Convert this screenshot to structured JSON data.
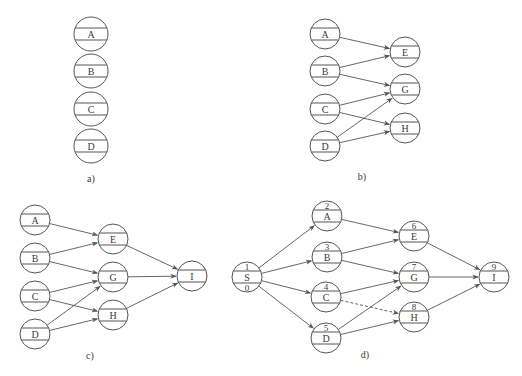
{
  "colors": {
    "stroke": "#555555",
    "text": "#3a3a3a",
    "background": "#ffffff"
  },
  "diagrams": [
    {
      "id": "a",
      "caption": "a)",
      "caption_pos": [
        91,
        182
      ],
      "radius": 17,
      "nodes": [
        {
          "id": "A",
          "label": "A",
          "x": 91,
          "y": 34
        },
        {
          "id": "B",
          "label": "B",
          "x": 91,
          "y": 71
        },
        {
          "id": "C",
          "label": "C",
          "x": 91,
          "y": 109
        },
        {
          "id": "D",
          "label": "D",
          "x": 91,
          "y": 146
        }
      ],
      "edges": []
    },
    {
      "id": "b",
      "caption": "b)",
      "caption_pos": [
        362,
        180
      ],
      "radius": 15,
      "nodes": [
        {
          "id": "A",
          "label": "A",
          "x": 325,
          "y": 34
        },
        {
          "id": "B",
          "label": "B",
          "x": 325,
          "y": 71
        },
        {
          "id": "C",
          "label": "C",
          "x": 325,
          "y": 109
        },
        {
          "id": "D",
          "label": "D",
          "x": 325,
          "y": 146
        },
        {
          "id": "E",
          "label": "E",
          "x": 405,
          "y": 52
        },
        {
          "id": "G",
          "label": "G",
          "x": 405,
          "y": 89
        },
        {
          "id": "H",
          "label": "H",
          "x": 405,
          "y": 128
        }
      ],
      "edges": [
        {
          "from": "A",
          "to": "E"
        },
        {
          "from": "B",
          "to": "E"
        },
        {
          "from": "B",
          "to": "G"
        },
        {
          "from": "C",
          "to": "G"
        },
        {
          "from": "C",
          "to": "H"
        },
        {
          "from": "D",
          "to": "G"
        },
        {
          "from": "D",
          "to": "H"
        }
      ]
    },
    {
      "id": "c",
      "caption": "c)",
      "caption_pos": [
        90,
        359
      ],
      "radius": 15,
      "nodes": [
        {
          "id": "A",
          "label": "A",
          "x": 35,
          "y": 220
        },
        {
          "id": "B",
          "label": "B",
          "x": 35,
          "y": 258
        },
        {
          "id": "C",
          "label": "C",
          "x": 35,
          "y": 296
        },
        {
          "id": "D",
          "label": "D",
          "x": 35,
          "y": 334
        },
        {
          "id": "E",
          "label": "E",
          "x": 113,
          "y": 239
        },
        {
          "id": "G",
          "label": "G",
          "x": 113,
          "y": 277
        },
        {
          "id": "H",
          "label": "H",
          "x": 113,
          "y": 315
        },
        {
          "id": "I",
          "label": "I",
          "x": 192,
          "y": 276
        }
      ],
      "edges": [
        {
          "from": "A",
          "to": "E"
        },
        {
          "from": "B",
          "to": "E"
        },
        {
          "from": "B",
          "to": "G"
        },
        {
          "from": "C",
          "to": "G"
        },
        {
          "from": "C",
          "to": "H"
        },
        {
          "from": "D",
          "to": "G"
        },
        {
          "from": "D",
          "to": "H"
        },
        {
          "from": "E",
          "to": "I"
        },
        {
          "from": "G",
          "to": "I"
        },
        {
          "from": "H",
          "to": "I"
        }
      ]
    },
    {
      "id": "d",
      "caption": "d)",
      "caption_pos": [
        365,
        358
      ],
      "radius": 15,
      "nodes": [
        {
          "id": "S",
          "num": "1",
          "label": "S",
          "bottom": "0",
          "x": 247,
          "y": 277
        },
        {
          "id": "A",
          "num": "2",
          "label": "A",
          "x": 327,
          "y": 216
        },
        {
          "id": "B",
          "num": "3",
          "label": "B",
          "x": 327,
          "y": 257
        },
        {
          "id": "C",
          "num": "4",
          "label": "C",
          "x": 326,
          "y": 297
        },
        {
          "id": "D",
          "num": "5",
          "label": "D",
          "x": 326,
          "y": 338
        },
        {
          "id": "E",
          "num": "6",
          "label": "E",
          "x": 414,
          "y": 236
        },
        {
          "id": "G",
          "num": "7",
          "label": "G",
          "x": 414,
          "y": 277
        },
        {
          "id": "H",
          "num": "8",
          "label": "H",
          "x": 414,
          "y": 317
        },
        {
          "id": "I",
          "num": "9",
          "label": "I",
          "x": 494,
          "y": 277
        }
      ],
      "edges": [
        {
          "from": "S",
          "to": "A"
        },
        {
          "from": "S",
          "to": "B"
        },
        {
          "from": "S",
          "to": "C"
        },
        {
          "from": "S",
          "to": "D"
        },
        {
          "from": "A",
          "to": "E"
        },
        {
          "from": "B",
          "to": "E"
        },
        {
          "from": "B",
          "to": "G"
        },
        {
          "from": "C",
          "to": "G"
        },
        {
          "from": "C",
          "to": "H",
          "dashed": true
        },
        {
          "from": "D",
          "to": "G"
        },
        {
          "from": "D",
          "to": "H"
        },
        {
          "from": "E",
          "to": "I"
        },
        {
          "from": "G",
          "to": "I"
        },
        {
          "from": "H",
          "to": "I"
        }
      ]
    }
  ]
}
